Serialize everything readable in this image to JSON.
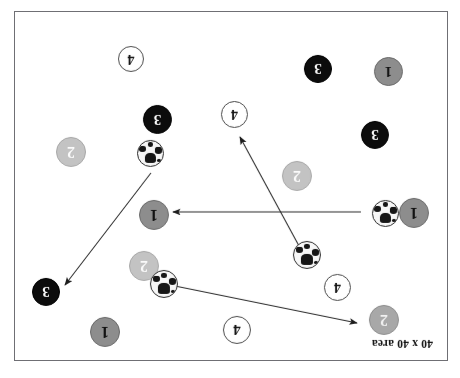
{
  "document": {
    "clipped_header_line": "r r  r   r   r   r    r     r  r  r  r   r,   p",
    "orientation_note": "diagram-rotated-180"
  },
  "diagram": {
    "caption": "40 x 40 area",
    "colors": {
      "team1": "#8d8d8d",
      "team2": "#a8a8a8",
      "team2_light": "#c3c3c3",
      "team3": "#0c0c0c",
      "team4": "#ffffff",
      "border": "#6f6f74",
      "line": "#2b2b2b"
    },
    "players": [
      {
        "label": "4",
        "kind": "t4",
        "x": 196,
        "y": 16,
        "d": 28
      },
      {
        "label": "1",
        "kind": "t1",
        "x": 327,
        "y": 13,
        "d": 30
      },
      {
        "label": "2",
        "kind": "t2",
        "x": 48,
        "y": 25,
        "d": 30
      },
      {
        "label": "3",
        "kind": "t3",
        "x": 387,
        "y": 54,
        "d": 28
      },
      {
        "label": "4",
        "kind": "t4",
        "x": 96,
        "y": 59,
        "d": 27
      },
      {
        "label": "2",
        "kind": "t2light",
        "x": 288,
        "y": 79,
        "d": 30
      },
      {
        "label": "1",
        "kind": "t1",
        "x": 18,
        "y": 132,
        "d": 30
      },
      {
        "label": "1",
        "kind": "t1",
        "x": 278,
        "y": 130,
        "d": 30
      },
      {
        "label": "2",
        "kind": "t2light",
        "x": 135,
        "y": 169,
        "d": 30
      },
      {
        "label": "2",
        "kind": "t2light",
        "x": 361,
        "y": 193,
        "d": 30
      },
      {
        "label": "3",
        "kind": "t3",
        "x": 58,
        "y": 211,
        "d": 28
      },
      {
        "label": "4",
        "kind": "t4",
        "x": 199,
        "y": 232,
        "d": 27
      },
      {
        "label": "3",
        "kind": "t3",
        "x": 275,
        "y": 226,
        "d": 29
      },
      {
        "label": "1",
        "kind": "t1",
        "x": 44,
        "y": 274,
        "d": 29
      },
      {
        "label": "3",
        "kind": "t3",
        "x": 115,
        "y": 277,
        "d": 28
      },
      {
        "label": "4",
        "kind": "t4",
        "x": 303,
        "y": 288,
        "d": 26
      }
    ],
    "balls": [
      {
        "x": 269,
        "y": 62,
        "d": 26
      },
      {
        "x": 126,
        "y": 91,
        "d": 26
      },
      {
        "x": 48,
        "y": 133,
        "d": 25
      },
      {
        "x": 283,
        "y": 193,
        "d": 25
      }
    ],
    "passes": [
      {
        "name": "pass-ball-to-player-2-topleft",
        "x1": 282,
        "y1": 76,
        "x2": 90,
        "y2": 37
      },
      {
        "name": "pass-ball-to-player-4-center",
        "x1": 142,
        "y1": 103,
        "x2": 207,
        "y2": 223
      },
      {
        "name": "pass-ball-to-player-1-right",
        "x1": 86,
        "y1": 148,
        "x2": 274,
        "y2": 148
      },
      {
        "name": "pass-ball-to-player-3-right",
        "x1": 296,
        "y1": 187,
        "x2": 382,
        "y2": 75
      }
    ]
  }
}
